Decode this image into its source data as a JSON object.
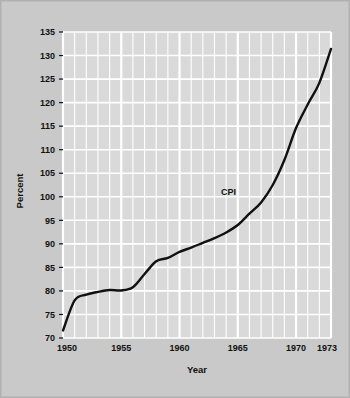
{
  "figure": {
    "background_color": "#c9c9c9",
    "plot_background_color": "#d9d9d9",
    "grid_color": "#ffffff",
    "line_color": "#111111",
    "text_color": "#111111"
  },
  "chart_data": {
    "type": "line",
    "title": "",
    "subtitle": "",
    "xlabel": "Year",
    "ylabel": "Percent",
    "xlim": [
      1950,
      1973
    ],
    "ylim": [
      70,
      135
    ],
    "grid": true,
    "legend_position": "inline-annotation",
    "x_tick_labels": [
      "1950",
      "1955",
      "1960",
      "1965",
      "1970",
      "1973"
    ],
    "x_tick_values": [
      1950,
      1955,
      1960,
      1965,
      1970,
      1973
    ],
    "x_minor_step": 1,
    "y_tick_labels": [
      "70",
      "75",
      "80",
      "85",
      "90",
      "95",
      "100",
      "105",
      "110",
      "115",
      "120",
      "125",
      "130",
      "135"
    ],
    "y_tick_values": [
      70,
      75,
      80,
      85,
      90,
      95,
      100,
      105,
      110,
      115,
      120,
      125,
      130,
      135
    ],
    "annotations": [
      {
        "text": "CPI",
        "x": 1964.2,
        "y": 100.3
      }
    ],
    "series": [
      {
        "name": "CPI",
        "color": "#111111",
        "x": [
          1950,
          1951,
          1952,
          1953,
          1954,
          1955,
          1956,
          1957,
          1958,
          1959,
          1960,
          1961,
          1962,
          1963,
          1964,
          1965,
          1966,
          1967,
          1968,
          1969,
          1970,
          1971,
          1972,
          1973
        ],
        "values": [
          71.6,
          78.0,
          79.2,
          79.8,
          80.2,
          80.1,
          80.8,
          83.6,
          86.3,
          87.0,
          88.3,
          89.2,
          90.2,
          91.2,
          92.4,
          94.0,
          96.4,
          98.8,
          102.5,
          107.8,
          114.6,
          119.6,
          124.2,
          131.4
        ]
      }
    ]
  }
}
